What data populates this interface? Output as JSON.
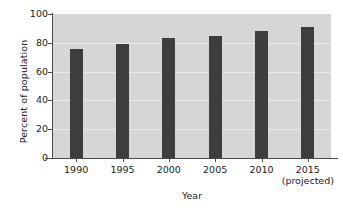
{
  "chart_data": {
    "type": "bar",
    "title": "",
    "subtitle": "",
    "categories": [
      "1990",
      "1995",
      "2000",
      "2005",
      "2010",
      "2015"
    ],
    "category_sublabels": [
      "",
      "",
      "",
      "",
      "",
      "(projected)"
    ],
    "values": [
      76,
      79,
      83,
      85,
      88,
      91
    ],
    "xlabel": "Year",
    "ylabel": "Percent of population",
    "ylim": [
      0,
      100
    ],
    "yticks": [
      0,
      20,
      40,
      60,
      80,
      100
    ],
    "ytick_labels": [
      "0",
      "20",
      "40",
      "60",
      "80",
      "100"
    ],
    "grid": true,
    "grid_axis": "y",
    "legend": false,
    "legend_position": "none",
    "bar_color": "#3d3d3d",
    "plot_background": "#d6d6d6",
    "figure_background": "#ffffff",
    "gridline_color": "#e9e9e9",
    "axis_color": "#4a4a4a",
    "text_color": "#1a1a1a"
  }
}
